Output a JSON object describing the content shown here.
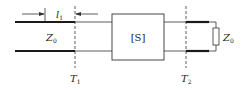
{
  "diagram": {
    "type": "two-port network with matched load",
    "labels": {
      "length": "l",
      "length_sub": "1",
      "z_left": "Z",
      "z_left_sub": "0",
      "network": "[S]",
      "z_load": "Z",
      "z_load_sub": "0",
      "ref_plane_1": "T",
      "ref_plane_1_sub": "1",
      "ref_plane_2": "T",
      "ref_plane_2_sub": "2"
    },
    "colors": {
      "line": "#1a1a1a",
      "thin_line": "#333333",
      "background": "#ffffff"
    }
  }
}
